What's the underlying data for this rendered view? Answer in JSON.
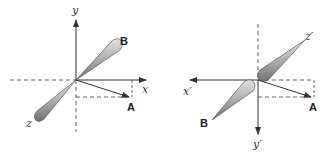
{
  "colors": {
    "axis": "#333333",
    "dashed": "#555555",
    "cone_light": "#d8d8d8",
    "cone_dark": "#7a7a7a",
    "cone_stroke": "#444444",
    "background": "#ffffff"
  },
  "left_figure": {
    "axis_labels": {
      "y": "y",
      "x": "x",
      "z": "z"
    },
    "points": {
      "A": "A",
      "B": "B"
    }
  },
  "right_figure": {
    "axis_labels": {
      "x": "x′",
      "y": "y′",
      "z": "z′"
    },
    "points": {
      "A": "A",
      "B": "B"
    }
  }
}
